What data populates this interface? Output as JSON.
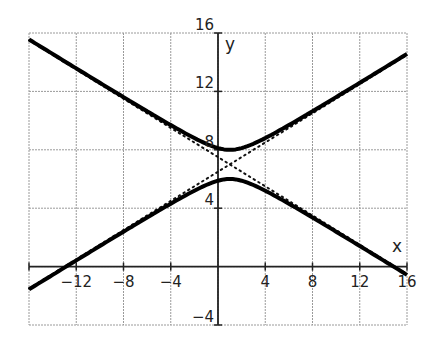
{
  "chart_data": {
    "type": "line",
    "title": "",
    "xlabel": "x",
    "ylabel": "y",
    "xlim": [
      -16,
      16
    ],
    "ylim": [
      -4,
      16
    ],
    "grid": true,
    "grid_step": 4,
    "x_ticks": [
      "-12",
      "-8",
      "-4",
      "4",
      "8",
      "12",
      "16"
    ],
    "x_tick_values": [
      -12,
      -8,
      -4,
      4,
      8,
      12,
      16
    ],
    "y_ticks": [
      "16",
      "12",
      "8",
      "4",
      "-4"
    ],
    "y_tick_values": [
      16,
      12,
      8,
      4,
      -4
    ],
    "series": [
      {
        "name": "hyperbola upper branch",
        "style": "solid",
        "center": [
          1,
          7
        ],
        "a": 1,
        "b": 2,
        "branch": "upper",
        "points": [
          [
            -16,
            15.56
          ],
          [
            -12,
            13.62
          ],
          [
            -8,
            11.71
          ],
          [
            -4,
            9.69
          ],
          [
            0,
            8.12
          ],
          [
            1,
            8
          ],
          [
            4,
            8.8
          ],
          [
            8,
            10.64
          ],
          [
            12,
            12.59
          ],
          [
            16,
            14.56
          ]
        ]
      },
      {
        "name": "hyperbola lower branch",
        "style": "solid",
        "center": [
          1,
          7
        ],
        "a": 1,
        "b": 2,
        "branch": "lower",
        "points": [
          [
            -16,
            -1.56
          ],
          [
            -12,
            0.38
          ],
          [
            -8,
            2.29
          ],
          [
            -4,
            4.31
          ],
          [
            0,
            5.88
          ],
          [
            1,
            6
          ],
          [
            4,
            5.2
          ],
          [
            8,
            3.36
          ],
          [
            12,
            1.41
          ],
          [
            16,
            -0.56
          ]
        ]
      },
      {
        "name": "asymptote 1",
        "style": "dotted",
        "points": [
          [
            -16,
            15.5
          ],
          [
            16,
            -0.5
          ]
        ]
      },
      {
        "name": "asymptote 2",
        "style": "dotted",
        "points": [
          [
            -16,
            -1.5
          ],
          [
            16,
            14.5
          ]
        ]
      }
    ]
  }
}
